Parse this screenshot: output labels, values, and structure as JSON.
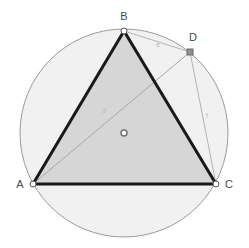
{
  "figure": {
    "background_color": "#ffffff"
  },
  "colors": {
    "circle_fill": "#f1f1f1",
    "circle_stroke": "#9a9a9a",
    "triangle_fill": "#d4d4d4",
    "triangle_stroke": "#1a1a1a",
    "thin_line_stroke": "#b0b0b0",
    "point_marker_fill": "#ffffff",
    "point_marker_stroke": "#555555",
    "point_d_fill": "#909090",
    "label_color": "#4a4a4a",
    "segment_label_color": "#b9b9b9"
  },
  "circle": {
    "name": "circumcircle",
    "center": {
      "x": 124,
      "y": 133
    },
    "radius": 104,
    "center_marker_label": "O"
  },
  "points": [
    {
      "id": "A",
      "label": "A",
      "x": 33,
      "y": 184,
      "label_x": 20,
      "label_y": 188,
      "marker": "circle-open"
    },
    {
      "id": "B",
      "label": "B",
      "x": 124,
      "y": 31,
      "label_x": 124,
      "label_y": 20,
      "marker": "circle-open"
    },
    {
      "id": "C",
      "label": "C",
      "x": 216,
      "y": 184,
      "label_x": 229,
      "label_y": 188,
      "marker": "circle-open"
    },
    {
      "id": "D",
      "label": "D",
      "x": 190,
      "y": 52,
      "label_x": 193,
      "label_y": 41,
      "marker": "square-filled"
    },
    {
      "id": "O",
      "label": "O",
      "x": 124,
      "y": 133,
      "label_x": 124,
      "label_y": 136,
      "marker": "circle-small"
    }
  ],
  "triangle": {
    "name": "triangle-ABC",
    "vertices": [
      "A",
      "B",
      "C"
    ],
    "path": "M 33 184 L 124 31 L 216 184 Z",
    "stroke_width": 3
  },
  "segments": [
    {
      "id": "BD",
      "label": "e",
      "from": "B",
      "to": "D",
      "x1": 124,
      "y1": 31,
      "x2": 190,
      "y2": 52,
      "label_x": 158,
      "label_y": 47
    },
    {
      "id": "AD",
      "label": "d",
      "from": "A",
      "to": "D",
      "x1": 33,
      "y1": 184,
      "x2": 190,
      "y2": 52,
      "label_x": 104,
      "label_y": 113
    },
    {
      "id": "DC",
      "label": "f",
      "from": "D",
      "to": "C",
      "x1": 190,
      "y1": 52,
      "x2": 216,
      "y2": 184,
      "label_x": 207,
      "label_y": 118
    }
  ]
}
